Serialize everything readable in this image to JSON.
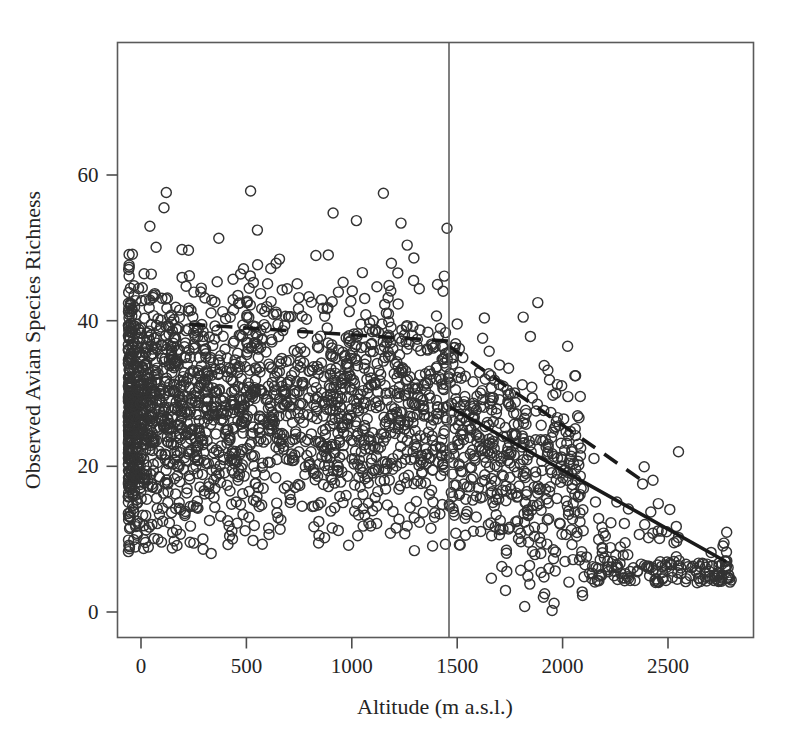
{
  "chart_data": {
    "type": "scatter",
    "title": "",
    "xlabel": "Altitude (m a.s.l.)",
    "ylabel": "Observed Avian Species Richness",
    "xlim": [
      -90,
      2860
    ],
    "ylim": [
      -5,
      70
    ],
    "xticks": [
      0,
      500,
      1000,
      1500,
      2000,
      2500
    ],
    "xtick_labels": [
      "0",
      "500",
      "1000",
      "1500",
      "2000",
      "2500"
    ],
    "yticks": [
      0,
      20,
      40,
      60
    ],
    "ytick_labels": [
      "0",
      "20",
      "40",
      "60"
    ],
    "grid": false,
    "legend": "none",
    "frame": "box",
    "marker": "open-circle",
    "marker_radius": 5,
    "n_points": 2600,
    "point_color": "#333333",
    "annotations": [
      {
        "name": "breakpoint-vertical-line",
        "type": "vline",
        "x": 1461,
        "style": "solid",
        "color": "#5f5f5f"
      }
    ],
    "series": [
      {
        "name": "observed-richness-points",
        "type": "scatter",
        "description": "Observed avian species richness per altitude, dense band 0-1450 m, thinning above 1500 m",
        "density_profile": [
          {
            "x_from": -60,
            "x_to": 900,
            "weight": 0.56,
            "y_center": 28,
            "y_spread": 8.5,
            "y_min": 8,
            "y_max": 58
          },
          {
            "x_from": 900,
            "x_to": 1461,
            "weight": 0.2,
            "y_center": 28,
            "y_spread": 8.5,
            "y_min": 8,
            "y_max": 58
          },
          {
            "x_from": 1461,
            "x_to": 2100,
            "weight": 0.17,
            "y_center": 24,
            "y_spread": 7.5,
            "y_min": 0,
            "y_max": 43
          },
          {
            "x_from": 2100,
            "x_to": 2800,
            "weight": 0.07,
            "y_center": 15,
            "y_spread": 5.5,
            "y_min": 4,
            "y_max": 26
          }
        ]
      },
      {
        "name": "lowland-trend-dashed",
        "type": "line",
        "style": "dashed",
        "points": [
          [
            230,
            39.5
          ],
          [
            1461,
            37.2
          ]
        ]
      },
      {
        "name": "highland-trend-dashed",
        "type": "line",
        "style": "dashed",
        "points": [
          [
            1461,
            36.5
          ],
          [
            2370,
            18.2
          ]
        ]
      },
      {
        "name": "overall-trend-solid",
        "type": "line",
        "style": "solid",
        "points": [
          [
            1461,
            28.2
          ],
          [
            2770,
            7.0
          ]
        ]
      }
    ]
  },
  "axes": {
    "x_title": "Altitude (m a.s.l.)",
    "y_title": "Observed Avian Species Richness"
  }
}
